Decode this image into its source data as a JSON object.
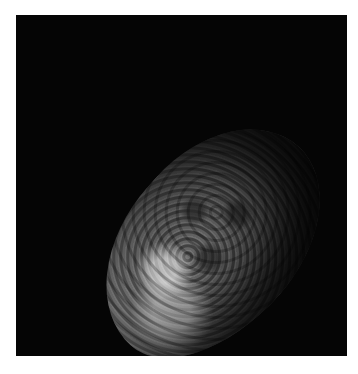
{
  "image": {
    "subject": "Irregular, heavily cratered sponge-like moon (Hyperion) on black background",
    "description": "Grayscale photograph of a potato-shaped cratered moon, tilted diagonally, lit from upper-left, set inside a black square frame with a white margin",
    "colors": {
      "background": "#ffffff",
      "frame": "#050505",
      "surface_light": "#d0d0d0",
      "surface_dark": "#3a3a3a"
    }
  }
}
